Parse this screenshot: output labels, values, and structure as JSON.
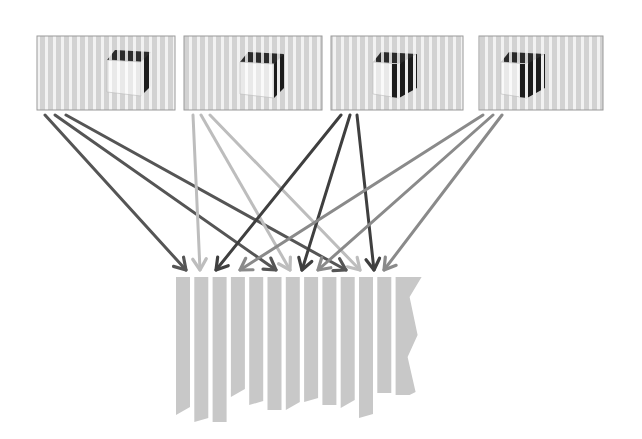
{
  "diagram": {
    "type": "view-interleaving",
    "colors": {
      "background": "#ffffff",
      "stripe_light": "#d4d4d4",
      "stripe_gap": "#f2f2f2",
      "panel_border": "#9a9a9a",
      "cube_face_light": "#f4f4f4",
      "cube_face_dark": "#1a1a1a",
      "output_stripe": "#c8c8c8"
    },
    "views": [
      {
        "id": "view-1",
        "x": 37,
        "y": 36,
        "w": 138,
        "h": 74,
        "arrow_color": "#555555",
        "cube_shade": "light-front"
      },
      {
        "id": "view-2",
        "x": 184,
        "y": 36,
        "w": 138,
        "h": 74,
        "arrow_color": "#bdbdbd",
        "cube_shade": "light-front"
      },
      {
        "id": "view-3",
        "x": 331,
        "y": 36,
        "w": 132,
        "h": 74,
        "arrow_color": "#3f3f3f",
        "cube_shade": "dark-side"
      },
      {
        "id": "view-4",
        "x": 479,
        "y": 36,
        "w": 124,
        "h": 74,
        "arrow_color": "#8a8a8a",
        "cube_shade": "dark-side"
      }
    ],
    "arrows": [
      {
        "from_view": 0,
        "x1": 45,
        "y1": 115,
        "x2": 186,
        "y2": 270
      },
      {
        "from_view": 0,
        "x1": 55,
        "y1": 115,
        "x2": 276,
        "y2": 270
      },
      {
        "from_view": 0,
        "x1": 66,
        "y1": 115,
        "x2": 346,
        "y2": 270
      },
      {
        "from_view": 1,
        "x1": 193,
        "y1": 115,
        "x2": 200,
        "y2": 270
      },
      {
        "from_view": 1,
        "x1": 201,
        "y1": 115,
        "x2": 290,
        "y2": 270
      },
      {
        "from_view": 1,
        "x1": 210,
        "y1": 115,
        "x2": 360,
        "y2": 270
      },
      {
        "from_view": 2,
        "x1": 341,
        "y1": 115,
        "x2": 216,
        "y2": 270
      },
      {
        "from_view": 2,
        "x1": 350,
        "y1": 115,
        "x2": 302,
        "y2": 270
      },
      {
        "from_view": 2,
        "x1": 357,
        "y1": 115,
        "x2": 374,
        "y2": 270
      },
      {
        "from_view": 3,
        "x1": 483,
        "y1": 115,
        "x2": 240,
        "y2": 270
      },
      {
        "from_view": 3,
        "x1": 493,
        "y1": 115,
        "x2": 318,
        "y2": 270
      },
      {
        "from_view": 3,
        "x1": 502,
        "y1": 115,
        "x2": 384,
        "y2": 270
      }
    ],
    "output": {
      "x": 176,
      "y": 277,
      "stripe_count": 13,
      "stripe_width": 14,
      "stripe_pitch": 18.3,
      "stripe_bottoms": [
        415,
        422,
        422,
        397,
        405,
        410,
        410,
        402,
        405,
        408,
        418,
        393,
        365
      ]
    }
  }
}
